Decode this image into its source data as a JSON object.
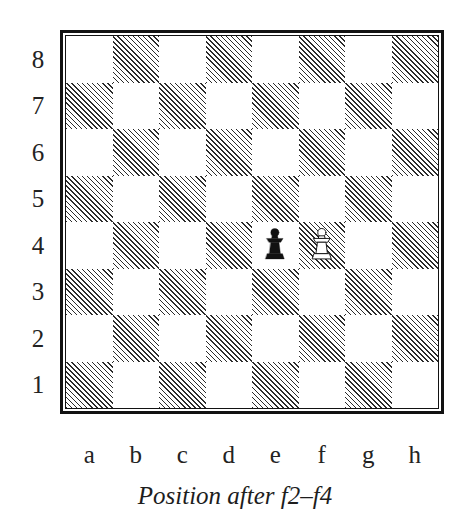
{
  "caption": "Position after f2–f4",
  "board": {
    "rank_labels": [
      "8",
      "7",
      "6",
      "5",
      "4",
      "3",
      "2",
      "1"
    ],
    "file_labels": [
      "a",
      "b",
      "c",
      "d",
      "e",
      "f",
      "g",
      "h"
    ],
    "orientation": "white-bottom",
    "light_square_color": "#ffffff",
    "dark_square_style": "diagonal-hatch",
    "dark_square_hatch_color": "#2b2b2b",
    "border_color": "#121212",
    "pieces": [
      {
        "square": "e4",
        "piece": "pawn",
        "color": "black",
        "symbol": "♟",
        "name": "black-pawn-e4"
      },
      {
        "square": "f4",
        "piece": "pawn",
        "color": "white",
        "symbol": "♙",
        "name": "white-pawn-f4"
      }
    ]
  },
  "chart_data": {
    "type": "table",
    "title": "Position after f2–f4",
    "categories": [
      "a",
      "b",
      "c",
      "d",
      "e",
      "f",
      "g",
      "h"
    ],
    "rows": [
      "8",
      "7",
      "6",
      "5",
      "4",
      "3",
      "2",
      "1"
    ],
    "notation": "8/8/8/8/4pP2/8/8/8",
    "occupied": [
      {
        "file": "e",
        "rank": "4",
        "color": "black",
        "piece": "pawn"
      },
      {
        "file": "f",
        "rank": "4",
        "color": "white",
        "piece": "pawn"
      }
    ],
    "xlabel": "file",
    "ylabel": "rank",
    "grid": true,
    "legend": "none"
  }
}
